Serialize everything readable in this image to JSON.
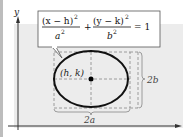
{
  "diagram": {
    "axes": {
      "x_label": "",
      "y_label": "y"
    },
    "equation": {
      "term1_num": "(x − h)",
      "term1_den": "a",
      "term2_num": "(y − k)",
      "term2_den": "b",
      "exp": "2",
      "plus": "+",
      "rhs": "= 1"
    },
    "center_label": "(h, k)",
    "width_label": "2a",
    "height_label": "2b",
    "colors": {
      "shade": "#ececec",
      "ellipse": "#111111",
      "dashed": "#888888",
      "axis": "#333333",
      "border": "#bbbbbb"
    }
  }
}
